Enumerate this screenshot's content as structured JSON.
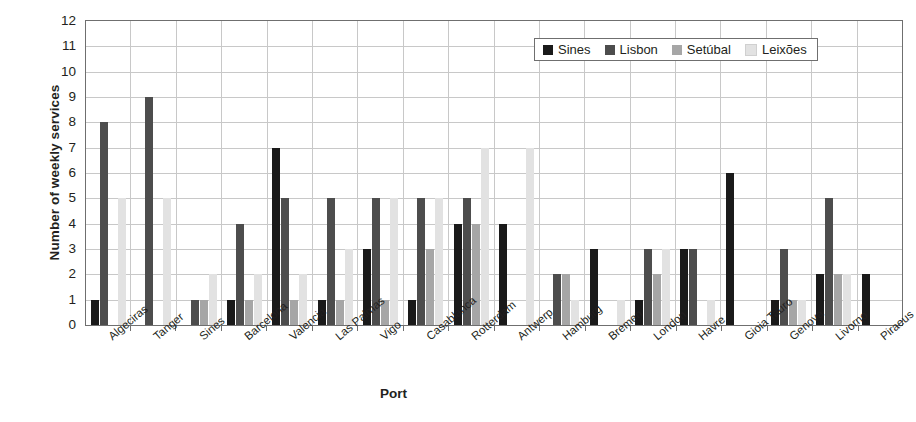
{
  "chart_data": {
    "type": "bar",
    "title": "",
    "xlabel": "Port",
    "ylabel": "Number of weekly services",
    "ylim": [
      0,
      12
    ],
    "ytick_step": 1,
    "yticks": [
      12,
      11,
      10,
      9,
      8,
      7,
      6,
      5,
      4,
      3,
      2,
      1,
      0
    ],
    "grid": "horizontal-and-vertical",
    "legend_position": "top-right-inside",
    "categories": [
      "Algeciras",
      "Tanger",
      "Sines",
      "Barcelona",
      "Valencia",
      "Las Palmas",
      "Vigo",
      "Casablanca",
      "Rotterdam",
      "Antwerp",
      "Hamburg",
      "Bremen",
      "London",
      "Havre",
      "Gioia Tauro",
      "Genova",
      "Livorno",
      "Piraeus"
    ],
    "series": [
      {
        "name": "Sines",
        "color": "#1a1a1a",
        "values": [
          1,
          0,
          0,
          1,
          7,
          1,
          3,
          1,
          4,
          4,
          0,
          3,
          1,
          3,
          6,
          1,
          2,
          2
        ]
      },
      {
        "name": "Lisbon",
        "color": "#4d4d4d",
        "values": [
          8,
          9,
          1,
          4,
          5,
          5,
          5,
          5,
          5,
          0,
          2,
          0,
          3,
          3,
          0,
          3,
          5,
          0
        ]
      },
      {
        "name": "Setúbal",
        "color": "#a6a6a6",
        "values": [
          0,
          0,
          1,
          1,
          1,
          1,
          1,
          3,
          4,
          0,
          2,
          0,
          2,
          0,
          0,
          1,
          2,
          0
        ]
      },
      {
        "name": "Leixões",
        "color": "#e2e2e2",
        "values": [
          5,
          5,
          2,
          2,
          2,
          3,
          5,
          5,
          7,
          7,
          1,
          1,
          3,
          1,
          0,
          1,
          2,
          0
        ]
      }
    ]
  },
  "axis": {
    "y_title": "Number of weekly services",
    "x_title": "Port"
  }
}
